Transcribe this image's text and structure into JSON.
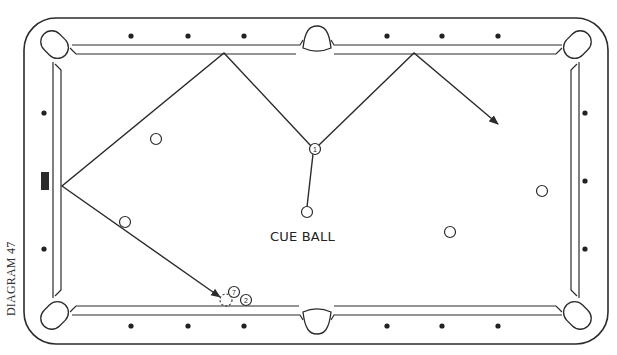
{
  "diagram": {
    "caption": "DIAGRAM 47",
    "cue_ball_label": "CUE BALL",
    "colors": {
      "line": "#2b2b2b",
      "background": "#ffffff",
      "diamond": "#222222"
    },
    "table": {
      "outer_rail": {
        "x": 24,
        "y": 18,
        "width": 584,
        "height": 326,
        "corner_radius": 32
      },
      "diamonds_top": [
        131,
        188,
        244,
        387,
        442,
        498
      ],
      "diamonds_bottom": [
        131,
        188,
        244,
        387,
        442,
        498
      ],
      "diamonds_left": [
        113,
        249
      ],
      "diamonds_right": [
        113,
        181,
        249
      ],
      "head_spot_marker": {
        "x": 41,
        "y": 172,
        "width": 8,
        "height": 18
      }
    },
    "balls": [
      {
        "name": "cue-ball",
        "x": 307,
        "y": 212,
        "label": ""
      },
      {
        "name": "object-ball-1",
        "x": 315,
        "y": 149,
        "label": "1"
      },
      {
        "name": "object-ball-7",
        "x": 234,
        "y": 292,
        "label": "7"
      },
      {
        "name": "object-ball-2",
        "x": 246,
        "y": 300,
        "label": "2"
      },
      {
        "name": "plain-ball-a",
        "x": 156,
        "y": 139,
        "label": ""
      },
      {
        "name": "plain-ball-b",
        "x": 125,
        "y": 222,
        "label": ""
      },
      {
        "name": "plain-ball-c",
        "x": 450,
        "y": 232,
        "label": ""
      },
      {
        "name": "plain-ball-d",
        "x": 542,
        "y": 191,
        "label": ""
      }
    ],
    "ghost_ball": {
      "x": 226,
      "y": 300
    },
    "paths": {
      "cue_to_ball1": [
        [
          307,
          207
        ],
        [
          313,
          154
        ]
      ],
      "object_ball_path": [
        [
          311,
          146
        ],
        [
          224,
          53
        ],
        [
          62,
          186
        ],
        [
          220,
          297
        ]
      ],
      "cue_ball_path": [
        [
          319,
          145
        ],
        [
          414,
          53
        ],
        [
          498,
          124
        ]
      ]
    }
  }
}
